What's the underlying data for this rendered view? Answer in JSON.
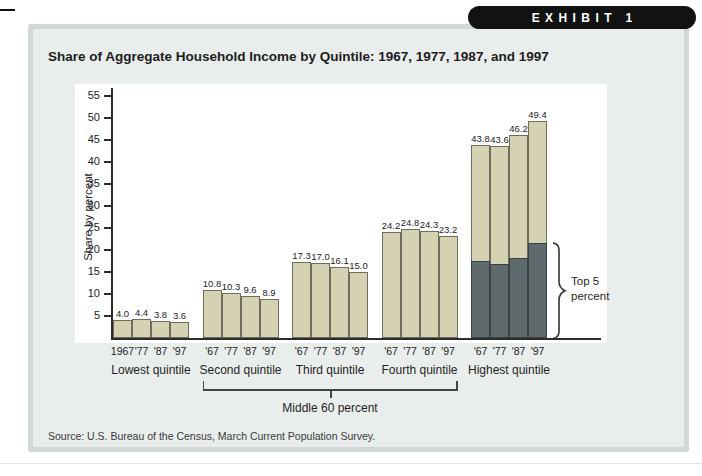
{
  "exhibit": {
    "label": "EXHIBIT 1"
  },
  "title": "Share of Aggregate Household Income by Quintile: 1967, 1977, 1987, and 1997",
  "source": "Source: U.S. Bureau of the Census, March Current Population Survey.",
  "chart_data": {
    "type": "bar",
    "title": "Share of Aggregate Household Income by Quintile: 1967, 1977, 1987, and 1997",
    "ylabel": "Share by percent",
    "ylim": [
      0,
      57
    ],
    "yticks": [
      5,
      10,
      15,
      20,
      25,
      30,
      35,
      40,
      45,
      50,
      55
    ],
    "grid": false,
    "groups": [
      {
        "label": "Lowest quintile",
        "tick_labels": [
          "1967",
          "'77",
          "'87",
          "'97"
        ],
        "values": [
          4.0,
          4.4,
          3.8,
          3.6
        ]
      },
      {
        "label": "Second quintile",
        "tick_labels": [
          "'67",
          "'77",
          "'87",
          "'97"
        ],
        "values": [
          10.8,
          10.3,
          9.6,
          8.9
        ]
      },
      {
        "label": "Third quintile",
        "tick_labels": [
          "'67",
          "'77",
          "'87",
          "'97"
        ],
        "values": [
          17.3,
          17.0,
          16.1,
          15.0
        ]
      },
      {
        "label": "Fourth quintile",
        "tick_labels": [
          "'67",
          "'77",
          "'87",
          "'97"
        ],
        "values": [
          24.2,
          24.8,
          24.3,
          23.2
        ]
      },
      {
        "label": "Highest quintile",
        "tick_labels": [
          "'67",
          "'77",
          "'87",
          "'97"
        ],
        "values": [
          43.8,
          43.6,
          46.2,
          49.4
        ],
        "top5_values_estimated": [
          17.5,
          16.8,
          18.2,
          21.7
        ]
      }
    ],
    "annotations": {
      "top5_line1": "Top 5",
      "top5_line2": "percent",
      "middle60": "Middle 60 percent"
    },
    "colors": {
      "bar_fill": "#d5d2b4",
      "bar_border": "#6e6c5a",
      "top5_fill": "#5f6a6d",
      "top5_border": "#3b4245",
      "axis": "#2b2b2b",
      "panel_bg": "#e9edec",
      "panel_border": "#d2d8d6",
      "pill_bg": "#121212",
      "pill_text": "#ffffff"
    }
  }
}
